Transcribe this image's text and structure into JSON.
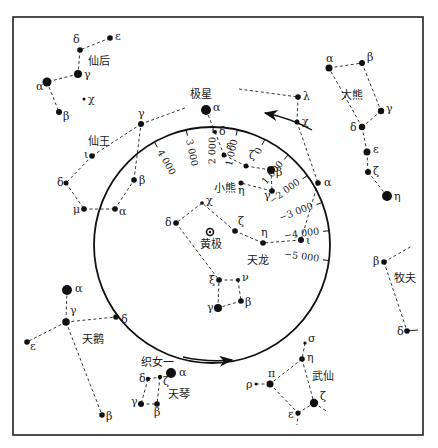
{
  "diagram": {
    "title": "",
    "frame": {
      "x": 13,
      "y": 17,
      "w": 410,
      "h": 418
    },
    "circle": {
      "cx": 212,
      "cy": 245,
      "r": 118,
      "label": "黄极",
      "center": [
        210,
        232
      ]
    },
    "arrows": [
      {
        "name": "arrow-top",
        "from": [
          312,
          130
        ],
        "to": [
          265,
          113
        ]
      },
      {
        "name": "arrow-bottom",
        "from": [
          183,
          357
        ],
        "to": [
          232,
          360
        ]
      }
    ],
    "precession_scale": {
      "ticks": [
        {
          "label": "4 000",
          "x": 160,
          "y": 152,
          "rot": 62
        },
        {
          "label": "3 000",
          "x": 188,
          "y": 138,
          "rot": 75
        },
        {
          "label": "2 000",
          "x": 213,
          "y": 134,
          "rot": 90
        },
        {
          "label": "1 000",
          "x": 236,
          "y": 136,
          "rot": 100
        },
        {
          "label": "0",
          "x": 262,
          "y": 145,
          "rot": 110
        },
        {
          "label": "1 000",
          "x": 283,
          "y": 161,
          "rot": -30
        },
        {
          "label": "−2 000",
          "x": 297,
          "y": 183,
          "rot": -20
        },
        {
          "label": "−3 000",
          "x": 300,
          "y": 211,
          "rot": -10
        },
        {
          "label": "−4 000",
          "x": 302,
          "y": 234,
          "rot": -3
        },
        {
          "label": "−5 000",
          "x": 302,
          "y": 257,
          "rot": 0
        }
      ]
    },
    "constellations": [
      {
        "name": "仙后",
        "label_pos": [
          88,
          65
        ],
        "stars": [
          {
            "id": "ε",
            "x": 110,
            "y": 38,
            "r": 2.8,
            "lx": 5,
            "ly": 2
          },
          {
            "id": "δ",
            "x": 80,
            "y": 50,
            "r": 2.8,
            "lx": -7,
            "ly": -7
          },
          {
            "id": "γ",
            "x": 78,
            "y": 74,
            "r": 4,
            "lx": 6,
            "ly": 4
          },
          {
            "id": "α",
            "x": 47,
            "y": 82,
            "r": 4.5,
            "lx": -11,
            "ly": 8
          },
          {
            "id": "β",
            "x": 59,
            "y": 112,
            "r": 3,
            "lx": 4,
            "ly": 8
          },
          {
            "id": "χ",
            "x": 84,
            "y": 99,
            "r": 1.5,
            "lx": 4,
            "ly": 4
          }
        ],
        "lines": [
          [
            "ε",
            "δ"
          ],
          [
            "δ",
            "γ"
          ],
          [
            "γ",
            "α"
          ],
          [
            "α",
            "β"
          ]
        ]
      },
      {
        "name": "仙王",
        "label_pos": [
          88,
          145
        ],
        "stars": [
          {
            "id": "γ",
            "x": 141,
            "y": 124,
            "r": 3,
            "lx": -3,
            "ly": -7
          },
          {
            "id": "ι",
            "x": 92,
            "y": 156,
            "r": 2.8,
            "lx": -8,
            "ly": 2
          },
          {
            "id": "δ",
            "x": 66,
            "y": 183,
            "r": 2.5,
            "lx": -9,
            "ly": 3
          },
          {
            "id": "μ",
            "x": 84,
            "y": 209,
            "r": 2.8,
            "lx": -11,
            "ly": 4
          },
          {
            "id": "α",
            "x": 115,
            "y": 209,
            "r": 2.8,
            "lx": 4,
            "ly": 6
          },
          {
            "id": "β",
            "x": 134,
            "y": 180,
            "r": 2.8,
            "lx": 5,
            "ly": 4
          },
          {
            "id": "far",
            "x": 185,
            "y": 108,
            "r": 2,
            "lx": 0,
            "ly": 0,
            "hide": true
          }
        ],
        "lines": [
          [
            "far",
            "γ"
          ],
          [
            "γ",
            "ι"
          ],
          [
            "ι",
            "δ"
          ],
          [
            "δ",
            "μ"
          ],
          [
            "μ",
            "α"
          ],
          [
            "α",
            "β"
          ],
          [
            "β",
            "γ"
          ]
        ]
      },
      {
        "name": "小熊",
        "label_pos": [
          214,
          192
        ],
        "stars": [
          {
            "id": "α",
            "x": 206,
            "y": 110,
            "r": 5,
            "lx": 7,
            "ly": 1,
            "label_extra": "极星"
          },
          {
            "id": "δ",
            "x": 215,
            "y": 132,
            "r": 2,
            "lx": 4,
            "ly": 3
          },
          {
            "id": "ε",
            "x": 224,
            "y": 155,
            "r": 2.5,
            "lx": 2,
            "ly": -6
          },
          {
            "id": "ζ",
            "x": 246,
            "y": 166,
            "r": 2.5,
            "lx": 3,
            "ly": -7
          },
          {
            "id": "β",
            "x": 271,
            "y": 170,
            "r": 4,
            "lx": 5,
            "ly": 6
          },
          {
            "id": "γ",
            "x": 272,
            "y": 191,
            "r": 2.8,
            "lx": -8,
            "ly": 8
          },
          {
            "id": "η",
            "x": 241,
            "y": 183,
            "r": 2.5,
            "lx": -3,
            "ly": 11
          }
        ],
        "lines": [
          [
            "α",
            "δ"
          ],
          [
            "δ",
            "ε"
          ],
          [
            "ε",
            "ζ"
          ],
          [
            "ζ",
            "β"
          ],
          [
            "β",
            "γ"
          ],
          [
            "γ",
            "η"
          ]
        ]
      },
      {
        "name": "天龙",
        "label_pos": [
          247,
          264
        ],
        "stars": [
          {
            "id": "λ",
            "x": 298,
            "y": 97,
            "r": 2.8,
            "lx": 5,
            "ly": 3
          },
          {
            "id": "far",
            "x": 239,
            "y": 89,
            "r": 2.8,
            "lx": 0,
            "ly": 0,
            "hide": true
          },
          {
            "id": "χ",
            "x": 297,
            "y": 122,
            "r": 2.5,
            "lx": 5,
            "ly": 3
          },
          {
            "id": "α",
            "x": 318,
            "y": 183,
            "r": 2.8,
            "lx": 6,
            "ly": 3
          },
          {
            "id": "ι",
            "x": 301,
            "y": 240,
            "r": 3,
            "lx": 5,
            "ly": 4
          },
          {
            "id": "η",
            "x": 263,
            "y": 243,
            "r": 2.8,
            "lx": -2,
            "ly": -7
          },
          {
            "id": "ζ",
            "x": 235,
            "y": 231,
            "r": 2.8,
            "lx": 3,
            "ly": -6
          },
          {
            "id": "χ2",
            "x": 202,
            "y": 203,
            "r": 1.8,
            "lx": 4,
            "ly": 1,
            "label": "χ"
          },
          {
            "id": "δ",
            "x": 176,
            "y": 223,
            "r": 2.8,
            "lx": -11,
            "ly": 3
          },
          {
            "id": "ξ",
            "x": 219,
            "y": 280,
            "r": 2.8,
            "lx": -10,
            "ly": 4
          },
          {
            "id": "ν",
            "x": 238,
            "y": 280,
            "r": 2,
            "lx": 4,
            "ly": 1
          },
          {
            "id": "β",
            "x": 241,
            "y": 301,
            "r": 2.8,
            "lx": 4,
            "ly": 5
          },
          {
            "id": "γ",
            "x": 218,
            "y": 308,
            "r": 4,
            "lx": -11,
            "ly": 3
          }
        ],
        "lines": [
          [
            "far",
            "λ"
          ],
          [
            "λ",
            "χ"
          ],
          [
            "χ",
            "α"
          ],
          [
            "α",
            "ι"
          ],
          [
            "ι",
            "η"
          ],
          [
            "η",
            "ζ"
          ],
          [
            "ζ",
            "χ2"
          ],
          [
            "χ2",
            "δ"
          ],
          [
            "δ",
            "ξ"
          ],
          [
            "ξ",
            "ν"
          ],
          [
            "ν",
            "β"
          ],
          [
            "β",
            "γ"
          ],
          [
            "γ",
            "ξ"
          ]
        ]
      },
      {
        "name": "大熊",
        "label_pos": [
          341,
          99
        ],
        "stars": [
          {
            "id": "α",
            "x": 329,
            "y": 68,
            "r": 3.5,
            "lx": -3,
            "ly": -6
          },
          {
            "id": "β",
            "x": 362,
            "y": 63,
            "r": 3,
            "lx": 5,
            "ly": -2
          },
          {
            "id": "γ",
            "x": 381,
            "y": 111,
            "r": 3.2,
            "lx": 5,
            "ly": 1
          },
          {
            "id": "δ",
            "x": 362,
            "y": 127,
            "r": 3.2,
            "lx": -12,
            "ly": 4
          },
          {
            "id": "ε",
            "x": 367,
            "y": 152,
            "r": 3.5,
            "lx": 6,
            "ly": 1
          },
          {
            "id": "ζ",
            "x": 368,
            "y": 172,
            "r": 3,
            "lx": 5,
            "ly": 3
          },
          {
            "id": "η",
            "x": 387,
            "y": 196,
            "r": 5,
            "lx": 7,
            "ly": 4
          }
        ],
        "lines": [
          [
            "α",
            "β"
          ],
          [
            "β",
            "γ"
          ],
          [
            "γ",
            "δ"
          ],
          [
            "δ",
            "α"
          ],
          [
            "δ",
            "ε"
          ],
          [
            "ε",
            "ζ"
          ],
          [
            "ζ",
            "η"
          ]
        ]
      },
      {
        "name": "天鹅",
        "label_pos": [
          82,
          343
        ],
        "stars": [
          {
            "id": "α",
            "x": 67,
            "y": 290,
            "r": 5,
            "lx": 8,
            "ly": 2
          },
          {
            "id": "γ",
            "x": 66,
            "y": 322,
            "r": 3.8,
            "lx": 4,
            "ly": -8
          },
          {
            "id": "δ",
            "x": 116,
            "y": 317,
            "r": 2.8,
            "lx": 5,
            "ly": 6
          },
          {
            "id": "ε",
            "x": 27,
            "y": 342,
            "r": 2.8,
            "lx": 3,
            "ly": 8
          },
          {
            "id": "β",
            "x": 102,
            "y": 415,
            "r": 2.8,
            "lx": 4,
            "ly": 5
          }
        ],
        "lines": [
          [
            "α",
            "γ"
          ],
          [
            "γ",
            "δ"
          ],
          [
            "γ",
            "ε"
          ],
          [
            "γ",
            "β"
          ]
        ]
      },
      {
        "name": "天琴",
        "label_pos": [
          168,
          398
        ],
        "stars": [
          {
            "id": "α",
            "x": 171,
            "y": 373,
            "r": 5,
            "lx": 8,
            "ly": 3,
            "label_extra": "织女一"
          },
          {
            "id": "δ",
            "x": 148,
            "y": 379,
            "r": 2.2,
            "lx": -9,
            "ly": 3
          },
          {
            "id": "ζ",
            "x": 160,
            "y": 377,
            "r": 2.2,
            "lx": 3,
            "ly": 8
          },
          {
            "id": "γ",
            "x": 141,
            "y": 404,
            "r": 3,
            "lx": -10,
            "ly": 1
          },
          {
            "id": "β",
            "x": 157,
            "y": 404,
            "r": 2.8,
            "lx": -3,
            "ly": 12
          }
        ],
        "lines": [
          [
            "δ",
            "ζ"
          ],
          [
            "δ",
            "γ"
          ],
          [
            "ζ",
            "β"
          ],
          [
            "γ",
            "β"
          ]
        ]
      },
      {
        "name": "武仙",
        "label_pos": [
          312,
          380
        ],
        "stars": [
          {
            "id": "σ",
            "x": 305,
            "y": 343,
            "r": 1.6,
            "lx": 3,
            "ly": -1
          },
          {
            "id": "η",
            "x": 302,
            "y": 359,
            "r": 2.8,
            "lx": 5,
            "ly": 2
          },
          {
            "id": "π",
            "x": 270,
            "y": 384,
            "r": 3.5,
            "lx": -2,
            "ly": -7
          },
          {
            "id": "ρ",
            "x": 256,
            "y": 384,
            "r": 1.5,
            "lx": -10,
            "ly": 4
          },
          {
            "id": "ε",
            "x": 298,
            "y": 413,
            "r": 2.6,
            "lx": -10,
            "ly": 5
          },
          {
            "id": "ζ",
            "x": 314,
            "y": 403,
            "r": 4.2,
            "lx": 6,
            "ly": -3
          },
          {
            "id": "tail1",
            "x": 328,
            "y": 412,
            "r": 0,
            "lx": 0,
            "ly": 0,
            "hide": true
          },
          {
            "id": "tail2",
            "x": 297,
            "y": 425,
            "r": 0,
            "lx": 0,
            "ly": 0,
            "hide": true
          }
        ],
        "lines": [
          [
            "σ",
            "η"
          ],
          [
            "η",
            "π"
          ],
          [
            "π",
            "ρ"
          ],
          [
            "π",
            "ε"
          ],
          [
            "η",
            "ζ"
          ],
          [
            "ε",
            "ζ"
          ],
          [
            "ζ",
            "tail1"
          ],
          [
            "ε",
            "tail2"
          ]
        ]
      },
      {
        "name": "牧夫",
        "label_pos": [
          394,
          282
        ],
        "stars": [
          {
            "id": "β",
            "x": 384,
            "y": 262,
            "r": 2.8,
            "lx": -11,
            "ly": 3
          },
          {
            "id": "δ",
            "x": 407,
            "y": 331,
            "r": 2.8,
            "lx": -10,
            "ly": 4
          },
          {
            "id": "far",
            "x": 412,
            "y": 246,
            "r": 0,
            "lx": 0,
            "ly": 0,
            "hide": true
          },
          {
            "id": "far2",
            "x": 418,
            "y": 330,
            "r": 0,
            "lx": 0,
            "ly": 0,
            "hide": true
          }
        ],
        "lines": [
          [
            "β",
            "far"
          ],
          [
            "β",
            "δ"
          ]
        ],
        "solid_lines": [
          [
            "δ",
            "far2"
          ]
        ]
      }
    ]
  }
}
